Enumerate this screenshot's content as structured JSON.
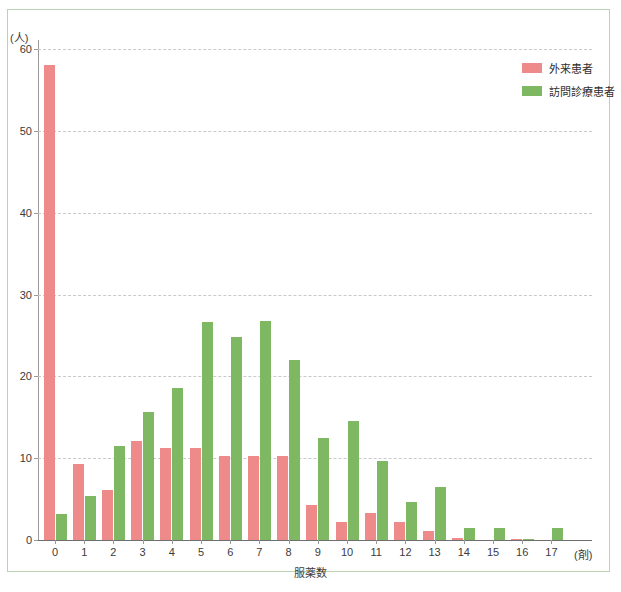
{
  "chart_data": {
    "type": "bar",
    "title": "",
    "xlabel": "服薬数",
    "xunit": "(剤)",
    "ylabel": "",
    "yunit": "(人)",
    "ylim": [
      0,
      60
    ],
    "yticks": [
      0,
      10,
      20,
      30,
      40,
      50,
      60
    ],
    "grid": true,
    "legend_position": "top-right",
    "categories": [
      "0",
      "1",
      "2",
      "3",
      "4",
      "5",
      "6",
      "7",
      "8",
      "9",
      "10",
      "11",
      "12",
      "13",
      "14",
      "15",
      "16",
      "17"
    ],
    "series": [
      {
        "name": "外来患者",
        "color": "#ef8a8a",
        "values": [
          58.0,
          9.3,
          6.1,
          12.1,
          11.3,
          11.3,
          10.3,
          10.3,
          10.3,
          4.3,
          2.2,
          3.3,
          2.2,
          1.1,
          0.2,
          0.0,
          0.1,
          0.0
        ]
      },
      {
        "name": "訪問診療患者",
        "color": "#7eb862",
        "values": [
          3.2,
          5.4,
          11.5,
          15.6,
          18.6,
          26.7,
          24.8,
          26.8,
          22.0,
          12.5,
          14.6,
          9.6,
          4.6,
          6.5,
          1.5,
          1.5,
          0.1,
          1.5
        ]
      }
    ]
  },
  "legend": {
    "items": [
      {
        "label": "外来患者",
        "color": "#ef8a8a"
      },
      {
        "label": "訪問診療患者",
        "color": "#7eb862"
      }
    ]
  },
  "colors": {
    "frame": "#b9d3b4",
    "grid": "#c9c9c9",
    "axis": "#6f6f6f",
    "text": "#3b3b3b"
  }
}
